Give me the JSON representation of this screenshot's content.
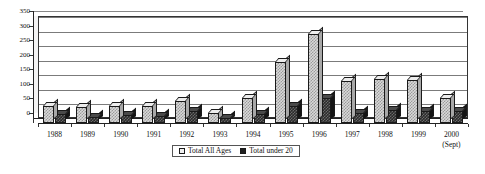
{
  "chart_data": {
    "type": "bar",
    "title": "",
    "subtitle": "",
    "xlabel": "",
    "ylabel": "",
    "ylim": [
      0,
      350
    ],
    "yticks": [
      0,
      50,
      100,
      150,
      200,
      250,
      300,
      350
    ],
    "grid": true,
    "legend_position": "bottom-center",
    "categories": [
      "1988",
      "1989",
      "1990",
      "1991",
      "1992",
      "1993",
      "1994",
      "1995",
      "1996",
      "1997",
      "1998",
      "1999",
      "2000"
    ],
    "category_notes": [
      "",
      "",
      "",
      "",
      "",
      "",
      "",
      "",
      "",
      "",
      "",
      "",
      "(Sept)"
    ],
    "series": [
      {
        "name": "Total All Ages",
        "style": "light-checkered",
        "values": [
          60,
          55,
          60,
          60,
          75,
          35,
          85,
          210,
          305,
          145,
          150,
          148,
          85
        ]
      },
      {
        "name": "Total under 20",
        "style": "dark-solid",
        "values": [
          30,
          22,
          28,
          25,
          40,
          18,
          30,
          60,
          85,
          35,
          45,
          40,
          40
        ]
      }
    ]
  },
  "legend": {
    "items": [
      {
        "label": "Total All Ages",
        "swatch": "light-swatch"
      },
      {
        "label": "Total under 20",
        "swatch": "dark-swatch"
      }
    ]
  },
  "axes": {
    "y_tick_labels": [
      "0",
      "50",
      "100",
      "150",
      "200",
      "250",
      "300",
      "350"
    ],
    "x_tick_labels": [
      "1988",
      "1989",
      "1990",
      "1991",
      "1992",
      "1993",
      "1994",
      "1995",
      "1996",
      "1997",
      "1998",
      "1999",
      "2000"
    ],
    "x_sub_labels": [
      "",
      "",
      "",
      "",
      "",
      "",
      "",
      "",
      "",
      "",
      "",
      "",
      "(Sept)"
    ]
  },
  "colors": {
    "axis": "#222222",
    "gridline": "#7b7b7b",
    "series_light": "#d9d9d9",
    "series_dark": "#2b2b2b",
    "background": "#ffffff"
  }
}
